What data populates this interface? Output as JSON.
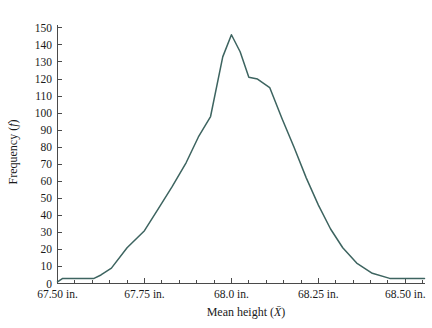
{
  "chart_data": {
    "type": "line",
    "title": "",
    "subtitle": "",
    "xlabel": "Mean height (X̄)",
    "xlabel_plain": "Mean height",
    "xlabel_symbol": "X",
    "ylabel": "Frequency (f)",
    "ylabel_plain": "Frequency",
    "ylabel_symbol": "f",
    "grid": false,
    "legend": false,
    "legend_position": "none",
    "line_color": "#3d6460",
    "axis_color": "#4a4a4a",
    "background_color": "#ffffff",
    "xlim": [
      67.5,
      68.555
    ],
    "ylim": [
      0,
      152
    ],
    "xticks_major": [
      67.5,
      67.75,
      68.0,
      68.25,
      68.5
    ],
    "xtick_labels": [
      "67.50 in.",
      "67.75 in.",
      "68.0 in.",
      "68.25 in.",
      "68.50 in."
    ],
    "xtick_minor_count_between": 4,
    "yticks": [
      0,
      10,
      20,
      30,
      40,
      50,
      60,
      70,
      80,
      90,
      100,
      110,
      120,
      130,
      140,
      150
    ],
    "ytick_labels": [
      "0",
      "10",
      "20",
      "30",
      "40",
      "50",
      "60",
      "70",
      "80",
      "90",
      "100",
      "110",
      "120",
      "130",
      "140",
      "150"
    ],
    "x": [
      67.5,
      67.515,
      67.56,
      67.605,
      67.625,
      67.655,
      67.7,
      67.75,
      67.79,
      67.83,
      67.87,
      67.905,
      67.94,
      67.975,
      68.0,
      68.025,
      68.05,
      68.075,
      68.11,
      68.145,
      68.18,
      68.215,
      68.25,
      68.285,
      68.32,
      68.36,
      68.405,
      68.455,
      68.51,
      68.555
    ],
    "values": [
      1,
      3,
      3,
      3,
      5,
      9,
      21,
      31,
      44,
      57,
      71,
      86,
      98,
      133,
      146,
      136,
      121,
      120,
      115,
      97,
      80,
      62,
      46,
      32,
      21,
      12,
      6,
      3,
      3,
      3
    ],
    "series": [
      {
        "name": "Frequency",
        "color": "#3d6460",
        "values": [
          1,
          3,
          3,
          3,
          5,
          9,
          21,
          31,
          44,
          57,
          71,
          86,
          98,
          133,
          146,
          136,
          121,
          120,
          115,
          97,
          80,
          62,
          46,
          32,
          21,
          12,
          6,
          3,
          3,
          3
        ]
      }
    ],
    "peak": {
      "x": 68.0,
      "y": 146
    },
    "annotations": []
  }
}
